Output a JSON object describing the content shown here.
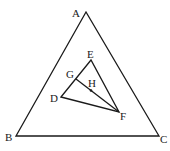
{
  "diagram": {
    "type": "geometry",
    "points": {
      "A": {
        "label": "A",
        "x": 86,
        "y": 12,
        "lx": 72,
        "ly": 17
      },
      "B": {
        "label": "B",
        "x": 16,
        "y": 136,
        "lx": 5,
        "ly": 141
      },
      "C": {
        "label": "C",
        "x": 159,
        "y": 136,
        "lx": 160,
        "ly": 143
      },
      "D": {
        "label": "D",
        "x": 61,
        "y": 97,
        "lx": 50,
        "ly": 102
      },
      "E": {
        "label": "E",
        "x": 91,
        "y": 60,
        "lx": 87,
        "ly": 58
      },
      "F": {
        "label": "F",
        "x": 119,
        "y": 112,
        "lx": 120,
        "ly": 120
      },
      "G": {
        "label": "G",
        "x": 76,
        "y": 79,
        "lx": 66,
        "ly": 78
      },
      "H": {
        "label": "H",
        "x": 91,
        "y": 90,
        "lx": 88,
        "ly": 87
      }
    },
    "segments": [
      [
        "A",
        "B"
      ],
      [
        "B",
        "C"
      ],
      [
        "C",
        "A"
      ],
      [
        "D",
        "E"
      ],
      [
        "E",
        "F"
      ],
      [
        "F",
        "D"
      ],
      [
        "G",
        "F"
      ]
    ],
    "marked_points": [
      "H"
    ]
  }
}
